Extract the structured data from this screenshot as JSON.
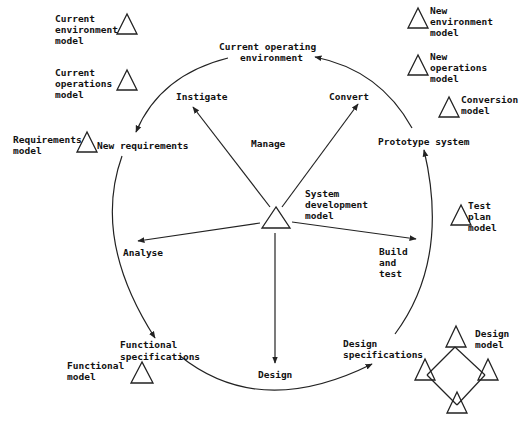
{
  "diagram": {
    "center": {
      "label_lines": [
        "System",
        "development",
        "model"
      ],
      "inner_label": "Manage"
    },
    "stages": {
      "current_operating_environment": [
        "Current operating",
        "environment"
      ],
      "new_requirements": [
        "New requirements"
      ],
      "functional_specifications": [
        "Functional",
        "specifications"
      ],
      "design_specifications": [
        "Design",
        "specifications"
      ],
      "prototype_system": [
        "Prototype system"
      ]
    },
    "activities": {
      "instigate": "Instigate",
      "convert": "Convert",
      "analyse": "Analyse",
      "design": "Design",
      "build_and_test": [
        "Build",
        "and",
        "test"
      ]
    },
    "models": {
      "current_environment": [
        "Current",
        "environment",
        "model"
      ],
      "current_operations": [
        "Current",
        "operations",
        "model"
      ],
      "requirements": [
        "Requirements",
        "model"
      ],
      "functional": [
        "Functional",
        "model"
      ],
      "new_environment": [
        "New",
        "environment",
        "model"
      ],
      "new_operations": [
        "New",
        "operations",
        "model"
      ],
      "conversion": [
        "Conversion",
        "model"
      ],
      "test_plan": [
        "Test",
        "plan",
        "model"
      ],
      "design": [
        "Design",
        "model"
      ]
    },
    "colors": {
      "line": "#222222",
      "background": "#ffffff"
    }
  }
}
